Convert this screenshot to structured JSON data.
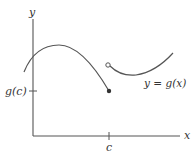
{
  "diagram": {
    "type": "function-graph",
    "colors": {
      "axis": "#555555",
      "curve": "#555555",
      "text": "#333333",
      "background": "#ffffff"
    },
    "axes": {
      "x_label": "x",
      "y_label": "y"
    },
    "ticks": {
      "x_tick_label": "c",
      "y_tick_label": "g(c)"
    },
    "curve_label": "y = g(x)",
    "points": {
      "closed": {
        "label": "(c, g(c))",
        "filled": true
      },
      "open": {
        "label": "right-hand limit at c",
        "filled": false
      }
    }
  }
}
